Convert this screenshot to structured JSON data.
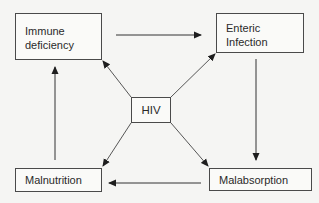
{
  "diagram": {
    "type": "cycle-with-hub",
    "nodes": [
      {
        "id": "immune",
        "label": "Immune\ndeficiency"
      },
      {
        "id": "enteric",
        "label": "Enteric\nInfection"
      },
      {
        "id": "hiv",
        "label": "HIV"
      },
      {
        "id": "malnutrition",
        "label": "Malnutrition"
      },
      {
        "id": "malabsorption",
        "label": "Malabsorption"
      }
    ],
    "edges": [
      {
        "from": "Immune deficiency",
        "to": "Enteric Infection"
      },
      {
        "from": "Enteric Infection",
        "to": "Malabsorption"
      },
      {
        "from": "Malabsorption",
        "to": "Malnutrition"
      },
      {
        "from": "Malnutrition",
        "to": "Immune deficiency"
      },
      {
        "from": "HIV",
        "to": "Immune deficiency"
      },
      {
        "from": "HIV",
        "to": "Enteric Infection"
      },
      {
        "from": "HIV",
        "to": "Malabsorption"
      },
      {
        "from": "HIV",
        "to": "Malnutrition"
      }
    ],
    "colors": {
      "line": "#3a3a3a",
      "box_border": "#4a4a4a",
      "text": "#2a2a2a",
      "background": "#f5f5f3"
    }
  }
}
